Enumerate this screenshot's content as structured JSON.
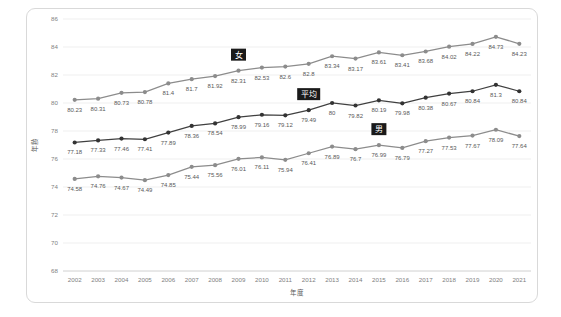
{
  "chart_data": {
    "type": "line",
    "title": "",
    "xlabel": "年度",
    "ylabel": "年齢",
    "ylim": [
      68,
      86
    ],
    "ytick_step": 2,
    "yticks": [
      68,
      70,
      72,
      74,
      76,
      78,
      80,
      82,
      84,
      86
    ],
    "grid": true,
    "legend_position": "inline-annotations",
    "categories": [
      "2002",
      "2003",
      "2004",
      "2005",
      "2006",
      "2007",
      "2008",
      "2009",
      "2010",
      "2011",
      "2012",
      "2013",
      "2014",
      "2015",
      "2016",
      "2017",
      "2018",
      "2019",
      "2020",
      "2021"
    ],
    "series": [
      {
        "name": "女",
        "color": "#8c8c8c",
        "values": [
          80.23,
          80.31,
          80.73,
          80.78,
          81.4,
          81.7,
          81.92,
          82.31,
          82.53,
          82.6,
          82.8,
          83.34,
          83.17,
          83.61,
          83.41,
          83.68,
          84.02,
          84.22,
          84.73,
          84.23
        ],
        "labels": [
          "80.23",
          "80.31",
          "80.73",
          "80.78",
          "81.4",
          "81.7",
          "81.92",
          "82.31",
          "82.53",
          "82.6",
          "82.8",
          "83.34",
          "83.17",
          "83.61",
          "83.41",
          "83.68",
          "84.02",
          "84.22",
          "84.73",
          "84.23"
        ]
      },
      {
        "name": "平均",
        "color": "#404040",
        "values": [
          77.18,
          77.33,
          77.46,
          77.41,
          77.89,
          78.36,
          78.54,
          78.99,
          79.16,
          79.12,
          79.49,
          80,
          79.82,
          80.19,
          79.98,
          80.38,
          80.67,
          80.84,
          81.3,
          80.84
        ],
        "labels": [
          "77.18",
          "77.33",
          "77.46",
          "77.41",
          "77.89",
          "78.36",
          "78.54",
          "78.99",
          "79.16",
          "79.12",
          "79.49",
          "80",
          "79.82",
          "80.19",
          "79.98",
          "80.38",
          "80.67",
          "80.84",
          "81.3",
          "80.84"
        ]
      },
      {
        "name": "男",
        "color": "#8c8c8c",
        "values": [
          74.58,
          74.76,
          74.67,
          74.49,
          74.85,
          75.44,
          75.56,
          76.01,
          76.11,
          75.94,
          76.41,
          76.89,
          76.7,
          76.99,
          76.79,
          77.27,
          77.53,
          77.67,
          78.09,
          77.64
        ],
        "labels": [
          "74.58",
          "74.76",
          "74.67",
          "74.49",
          "74.85",
          "75.44",
          "75.56",
          "76.01",
          "76.11",
          "75.94",
          "76.41",
          "76.89",
          "76.7",
          "76.99",
          "76.79",
          "77.27",
          "77.53",
          "77.67",
          "78.09",
          "77.64"
        ]
      }
    ],
    "annotations": [
      {
        "text": "女",
        "series": "女",
        "at_category": "2009"
      },
      {
        "text": "平均",
        "series": "平均",
        "at_category": "2012"
      },
      {
        "text": "男",
        "series": "男",
        "at_category": "2015"
      }
    ]
  }
}
